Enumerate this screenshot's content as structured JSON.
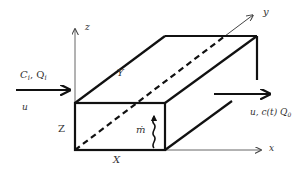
{
  "diagram": {
    "type": "control-volume-box",
    "axes": {
      "x": "x",
      "y": "y",
      "z": "z"
    },
    "dimensions": {
      "length_x": "X",
      "width_y": "Y",
      "height_z": "Z"
    },
    "inflow": {
      "top_label": "C",
      "top_label_sub": "i",
      "top_label_sep": ", Q",
      "top_label_sub2": "i",
      "bottom_label": "u"
    },
    "outflow": {
      "label": "u, c(t)  Q",
      "label_sub": "0"
    },
    "source": {
      "label": "ṁ"
    },
    "colors": {
      "stroke": "#111111",
      "text": "#333333",
      "axis": "#555555"
    }
  }
}
